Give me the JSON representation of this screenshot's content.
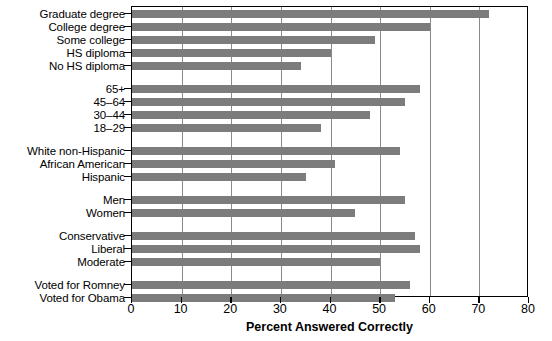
{
  "chart_data": {
    "type": "bar",
    "orientation": "horizontal",
    "title": "",
    "xlabel": "Percent Answered Correctly",
    "ylabel": "",
    "xlim": [
      0,
      80
    ],
    "xticks": [
      0,
      10,
      20,
      30,
      40,
      50,
      60,
      70,
      80
    ],
    "xtick_labels": [
      "0",
      "10",
      "20",
      "30",
      "40",
      "50",
      "60",
      "70",
      "80"
    ],
    "grid": "vertical",
    "legend": "none",
    "bar_color": "#7c7c7c",
    "groups": [
      {
        "name": "education",
        "categories": [
          "Graduate degree",
          "College degree",
          "Some college",
          "HS diploma",
          "No HS diploma"
        ],
        "values": [
          72,
          60,
          49,
          40,
          34
        ]
      },
      {
        "name": "age",
        "categories": [
          "65+",
          "45–64",
          "30–44",
          "18–29"
        ],
        "values": [
          58,
          55,
          48,
          38
        ]
      },
      {
        "name": "race",
        "categories": [
          "White non-Hispanic",
          "African American",
          "Hispanic"
        ],
        "values": [
          54,
          41,
          35
        ]
      },
      {
        "name": "gender",
        "categories": [
          "Men",
          "Women"
        ],
        "values": [
          55,
          45
        ]
      },
      {
        "name": "ideology",
        "categories": [
          "Conservative",
          "Liberal",
          "Moderate"
        ],
        "values": [
          57,
          58,
          50
        ]
      },
      {
        "name": "vote",
        "categories": [
          "Voted for Romney",
          "Voted for Obama"
        ],
        "values": [
          56,
          53
        ]
      }
    ],
    "categories": [
      "Graduate degree",
      "College degree",
      "Some college",
      "HS diploma",
      "No HS diploma",
      "65+",
      "45–64",
      "30–44",
      "18–29",
      "White non-Hispanic",
      "African American",
      "Hispanic",
      "Men",
      "Women",
      "Conservative",
      "Liberal",
      "Moderate",
      "Voted for Romney",
      "Voted for Obama"
    ],
    "values": [
      72,
      60,
      49,
      40,
      34,
      58,
      55,
      48,
      38,
      54,
      41,
      35,
      55,
      45,
      57,
      58,
      50,
      56,
      53
    ]
  }
}
